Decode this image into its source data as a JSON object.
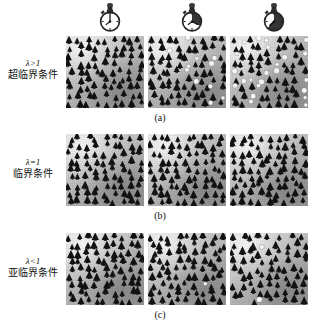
{
  "figure": {
    "type": "nuclear-chain-reaction-criticality-diagram",
    "background": "#ffffff",
    "columns": 3,
    "rows": 3
  },
  "clocks": [
    {
      "name": "stopwatch-t1",
      "elapsed_fraction": 0.0,
      "label": "t1"
    },
    {
      "name": "stopwatch-t2",
      "elapsed_fraction": 0.33,
      "label": "t2"
    },
    {
      "name": "stopwatch-t3",
      "elapsed_fraction": 0.62,
      "label": "t3"
    }
  ],
  "rows": [
    {
      "id": "supercritical",
      "lambda": "λ>1",
      "chinese": "超临界条件",
      "caption": "(a)",
      "panels": [
        {
          "dark_count": 78,
          "light_count": 0
        },
        {
          "dark_count": 70,
          "light_count": 34
        },
        {
          "dark_count": 58,
          "light_count": 60
        }
      ]
    },
    {
      "id": "critical",
      "lambda": "λ=1",
      "chinese": "临界条件",
      "caption": "(b)",
      "panels": [
        {
          "dark_count": 88,
          "light_count": 3
        },
        {
          "dark_count": 86,
          "light_count": 3
        },
        {
          "dark_count": 86,
          "light_count": 3
        }
      ]
    },
    {
      "id": "subcritical",
      "lambda": "λ<1",
      "chinese": "亚临界条件",
      "caption": "(c)",
      "panels": [
        {
          "dark_count": 92,
          "light_count": 10
        },
        {
          "dark_count": 80,
          "light_count": 2
        },
        {
          "dark_count": 70,
          "light_count": 2
        }
      ]
    }
  ],
  "colors": {
    "particle_dark": "#121212",
    "particle_light": "#f4f4f4",
    "panel_base": "#c0c0c0",
    "text": "#111111"
  },
  "chart_data": {
    "type": "heatmap",
    "title": "",
    "xlabel": "",
    "ylabel": "",
    "categories": [
      "t1",
      "t2",
      "t3"
    ],
    "series": [
      {
        "name": "λ>1 超临界条件",
        "values": [
          78,
          104,
          118
        ]
      },
      {
        "name": "λ=1 临界条件",
        "values": [
          91,
          89,
          89
        ]
      },
      {
        "name": "λ<1 亚临界条件",
        "values": [
          102,
          82,
          72
        ]
      }
    ]
  }
}
